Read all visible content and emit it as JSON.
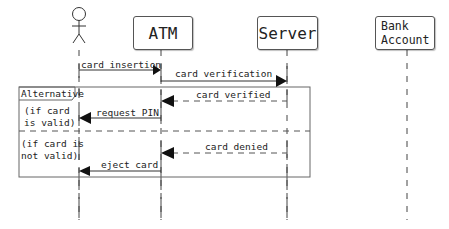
{
  "diagram": {
    "type": "sequence",
    "participants": [
      {
        "id": "user",
        "kind": "actor",
        "label": ""
      },
      {
        "id": "atm",
        "kind": "box",
        "label": "ATM"
      },
      {
        "id": "server",
        "kind": "box",
        "label": "Server"
      },
      {
        "id": "bank",
        "kind": "box",
        "label": "Bank\nAccount",
        "label_line1": "Bank",
        "label_line2": "Account"
      }
    ],
    "messages": [
      {
        "from": "user",
        "to": "atm",
        "label": "card insertion",
        "style": "solid"
      },
      {
        "from": "atm",
        "to": "server",
        "label": "card verification",
        "style": "solid"
      },
      {
        "from": "server",
        "to": "atm",
        "label": "card verified",
        "style": "dashed"
      },
      {
        "from": "atm",
        "to": "user",
        "label": "request PIN",
        "style": "solid"
      },
      {
        "from": "server",
        "to": "atm",
        "label": "card denied",
        "style": "dashed"
      },
      {
        "from": "atm",
        "to": "user",
        "label": "eject card",
        "style": "solid"
      }
    ],
    "fragment": {
      "operator": "Alternative",
      "guards": [
        {
          "text": "(if card\nis valid)"
        },
        {
          "text": "(if card is\nnot valid)"
        }
      ]
    },
    "colors": {
      "line": "#333333",
      "box_border": "#555555",
      "background": "#ffffff"
    }
  }
}
